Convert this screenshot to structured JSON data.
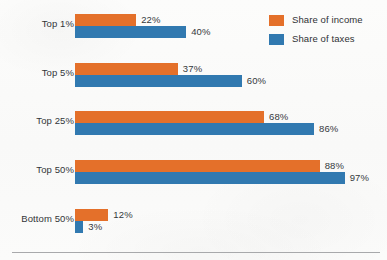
{
  "chart_data": {
    "type": "bar",
    "orientation": "horizontal",
    "title": "",
    "xlabel": "",
    "ylabel": "",
    "xlim": [
      0,
      100
    ],
    "grid": false,
    "legend_position": "top-right",
    "value_suffix": "%",
    "categories": [
      "Top 1%",
      "Top 5%",
      "Top 25%",
      "Top 50%",
      "Bottom 50%"
    ],
    "series": [
      {
        "name": "Share of income",
        "color": "#e4702a",
        "values": [
          22,
          37,
          68,
          88,
          12
        ],
        "labels": [
          "22%",
          "37%",
          "68%",
          "88%",
          "12%"
        ]
      },
      {
        "name": "Share of taxes",
        "color": "#3179b0",
        "values": [
          40,
          60,
          86,
          97,
          3
        ],
        "labels": [
          "40%",
          "60%",
          "86%",
          "97%",
          "3%"
        ]
      }
    ]
  },
  "legend": {
    "items": [
      {
        "label": "Share of income",
        "color": "#e4702a"
      },
      {
        "label": "Share of taxes",
        "color": "#3179b0"
      }
    ]
  }
}
